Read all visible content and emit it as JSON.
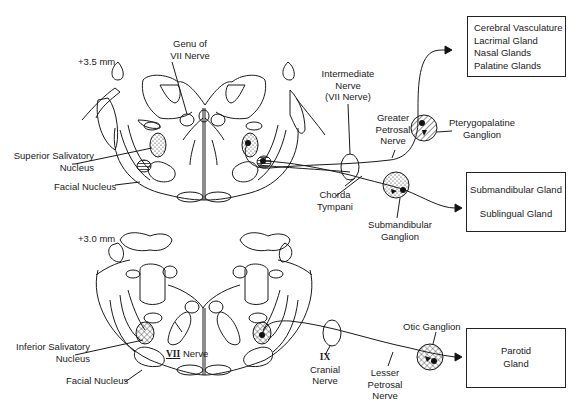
{
  "figure": {
    "sections": [
      {
        "id": "upper",
        "level_label": "+3.5 mm",
        "labels": {
          "genu": [
            "Genu of",
            "VII Nerve"
          ],
          "superior_salivatory": [
            "Superior Salivatory",
            "Nucleus"
          ],
          "facial_nucleus": "Facial Nucleus",
          "intermediate_nerve": [
            "Intermediate",
            "Nerve",
            "(VII Nerve)"
          ],
          "greater_petrosal": [
            "Greater",
            "Petrosal",
            "Nerve"
          ],
          "pterygopalatine": [
            "Pterygopalatine",
            "Ganglion"
          ],
          "chorda_tympani": [
            "Chorda",
            "Tympani"
          ],
          "submandibular_ganglion": [
            "Submandibular",
            "Ganglion"
          ]
        }
      },
      {
        "id": "lower",
        "level_label": "+3.0 mm",
        "labels": {
          "inferior_salivatory": [
            "Inferior Salivatory",
            "Nucleus"
          ],
          "vii_nerve": [
            "VII",
            "Nerve"
          ],
          "facial_nucleus": "Facial Nucleus",
          "cranial_nerve_ix": [
            "IX",
            "Cranial",
            "Nerve"
          ],
          "lesser_petrosal": [
            "Lesser",
            "Petrosal",
            "Nerve"
          ],
          "otic_ganglion": "Otic Ganglion"
        }
      }
    ],
    "targets": {
      "pterygopalatine_box": [
        "Cerebral Vasculature",
        "Lacrimal Gland",
        "Nasal Glands",
        "Palatine Glands"
      ],
      "submandibular_box": [
        "Submandibular Gland",
        "Sublingual Gland"
      ],
      "parotid_box": [
        "Parotid",
        "Gland"
      ]
    },
    "colors": {
      "ink": "#1a1a1a",
      "background": "#ffffff"
    }
  }
}
